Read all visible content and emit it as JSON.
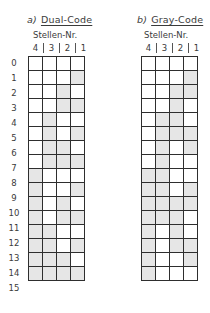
{
  "figure": {
    "panels": [
      {
        "prefix": "a)",
        "title": "Dual-Code",
        "subtitle": "Stellen-Nr.",
        "digit_positions": [
          "4",
          "3",
          "2",
          "1"
        ],
        "rows": [
          [
            0,
            0,
            0,
            0
          ],
          [
            0,
            0,
            0,
            1
          ],
          [
            0,
            0,
            1,
            0
          ],
          [
            0,
            0,
            1,
            1
          ],
          [
            0,
            1,
            0,
            0
          ],
          [
            0,
            1,
            0,
            1
          ],
          [
            0,
            1,
            1,
            0
          ],
          [
            0,
            1,
            1,
            1
          ],
          [
            1,
            0,
            0,
            0
          ],
          [
            1,
            0,
            0,
            1
          ],
          [
            1,
            0,
            1,
            0
          ],
          [
            1,
            0,
            1,
            1
          ],
          [
            1,
            1,
            0,
            0
          ],
          [
            1,
            1,
            0,
            1
          ],
          [
            1,
            1,
            1,
            0
          ],
          [
            1,
            1,
            1,
            1
          ]
        ]
      },
      {
        "prefix": "b)",
        "title": "Gray-Code",
        "subtitle": "Stellen-Nr.",
        "digit_positions": [
          "4",
          "3",
          "2",
          "1"
        ],
        "rows": [
          [
            0,
            0,
            0,
            0
          ],
          [
            0,
            0,
            0,
            1
          ],
          [
            0,
            0,
            1,
            1
          ],
          [
            0,
            0,
            1,
            0
          ],
          [
            0,
            1,
            1,
            0
          ],
          [
            0,
            1,
            1,
            1
          ],
          [
            0,
            1,
            0,
            1
          ],
          [
            0,
            1,
            0,
            0
          ],
          [
            1,
            1,
            0,
            0
          ],
          [
            1,
            1,
            0,
            1
          ],
          [
            1,
            1,
            1,
            1
          ],
          [
            1,
            1,
            1,
            0
          ],
          [
            1,
            0,
            1,
            0
          ],
          [
            1,
            0,
            1,
            1
          ],
          [
            1,
            0,
            0,
            1
          ],
          [
            1,
            0,
            0,
            0
          ]
        ]
      }
    ],
    "row_labels": [
      "0",
      "1",
      "2",
      "3",
      "4",
      "5",
      "6",
      "7",
      "8",
      "9",
      "10",
      "11",
      "12",
      "13",
      "14",
      "15"
    ],
    "colors": {
      "filled": "#e6e6e6",
      "empty": "#ffffff",
      "line": "#2e2e2e"
    }
  }
}
